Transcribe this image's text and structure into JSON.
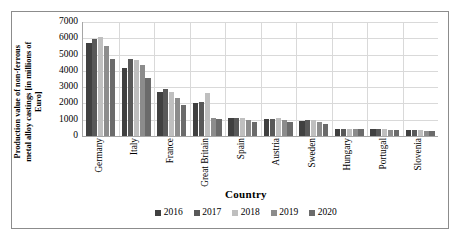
{
  "chart_data": {
    "type": "bar",
    "title": "",
    "subtitle": "",
    "xlabel": "Country",
    "ylabel": "Production value of non-ferrous metal alloy castings [in millions of Euro]",
    "ylabel_lines": [
      "Production value of non-ferrous",
      "metal alloy castings [in millions of",
      "Euro]"
    ],
    "categories": [
      "Germany",
      "Italy",
      "France",
      "Great Britain",
      "Spain",
      "Austria",
      "Sweden",
      "Hungary",
      "Portugal",
      "Slovenia"
    ],
    "ylim": [
      0,
      7000
    ],
    "ytick_labels": [
      "0",
      "1000",
      "2000",
      "3000",
      "4000",
      "5000",
      "6000",
      "7000"
    ],
    "ytick_values": [
      0,
      1000,
      2000,
      3000,
      4000,
      5000,
      6000,
      7000
    ],
    "grid": "horizontal-and-vertical",
    "legend_position": "bottom",
    "series": [
      {
        "name": "2016",
        "color": "#404040",
        "values": [
          5720,
          4180,
          2710,
          2000,
          1120,
          1030,
          930,
          420,
          420,
          340
        ]
      },
      {
        "name": "2017",
        "color": "#595959",
        "values": [
          5930,
          4700,
          2880,
          2090,
          1130,
          1070,
          960,
          430,
          430,
          350
        ]
      },
      {
        "name": "2018",
        "color": "#bfbfbf",
        "values": [
          6050,
          4660,
          2700,
          2620,
          1120,
          1130,
          980,
          430,
          420,
          340
        ]
      },
      {
        "name": "2019",
        "color": "#8c8c8c",
        "values": [
          5550,
          4370,
          2340,
          1130,
          990,
          1000,
          890,
          420,
          370,
          330
        ]
      },
      {
        "name": "2020",
        "color": "#6b6b6b",
        "values": [
          4740,
          3590,
          1900,
          1050,
          860,
          870,
          750,
          420,
          360,
          320
        ]
      }
    ]
  },
  "legend": {
    "items": [
      {
        "label": "2016"
      },
      {
        "label": "2017"
      },
      {
        "label": "2018"
      },
      {
        "label": "2019"
      },
      {
        "label": "2020"
      }
    ]
  },
  "colors": {
    "series_2016": "#404040",
    "series_2017": "#595959",
    "series_2018": "#bfbfbf",
    "series_2019": "#8c8c8c",
    "series_2020": "#6b6b6b",
    "gridline": "#d9d9d9",
    "axis": "#a6a6a6",
    "border": "#8c8c8c",
    "text": "#000000",
    "background": "#ffffff"
  }
}
